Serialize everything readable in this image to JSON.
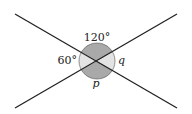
{
  "diagram": {
    "center": [
      97,
      61
    ],
    "angle_marker_radius": 18,
    "lines": [
      {
        "name": "line-a",
        "from": [
          15,
          14
        ],
        "to": [
          177,
          108
        ]
      },
      {
        "name": "line-b",
        "from": [
          15,
          108
        ],
        "to": [
          177,
          14
        ]
      }
    ],
    "colors": {
      "line": "#222222",
      "dark_sector": "#a9a9a9",
      "light_sector": "#e3e3e3"
    },
    "labels": {
      "top": "120°",
      "left": "60°",
      "right": "q",
      "bottom": "p"
    }
  }
}
